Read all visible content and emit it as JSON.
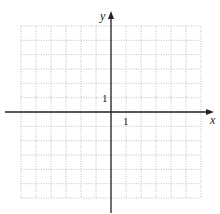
{
  "diagram": {
    "type": "coordinate-grid",
    "x_axis_label": "x",
    "y_axis_label": "y",
    "x_tick_label": "1",
    "y_tick_label": "1",
    "grid": {
      "columns": 12,
      "rows": 12,
      "x_min": -6,
      "x_max": 6,
      "y_min": -6,
      "y_max": 6,
      "style": "dotted"
    },
    "colors": {
      "grid": "#bbbbbb",
      "axis": "#222222",
      "background": "#ffffff"
    }
  }
}
